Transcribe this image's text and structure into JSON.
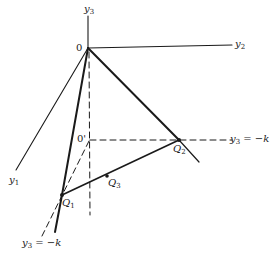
{
  "diagram": {
    "type": "3d-geometry",
    "colors": {
      "line": "#1a1a1a",
      "background": "#ffffff"
    },
    "axes": {
      "y1": {
        "label": "y",
        "sub": "1"
      },
      "y2": {
        "label": "y",
        "sub": "2"
      },
      "y3": {
        "label": "y",
        "sub": "3"
      }
    },
    "points": {
      "origin": {
        "label": "0"
      },
      "origin_prime": {
        "label": "0'"
      },
      "Q1": {
        "label": "Q",
        "sub": "1"
      },
      "Q2": {
        "label": "Q",
        "sub": "2"
      },
      "Q3": {
        "label": "Q",
        "sub": "3"
      }
    },
    "plane_labels": {
      "right": {
        "var": "y",
        "sub": "3",
        "rest": " = −k"
      },
      "bottom": {
        "var": "y",
        "sub": "3",
        "rest": " = −k"
      }
    }
  }
}
